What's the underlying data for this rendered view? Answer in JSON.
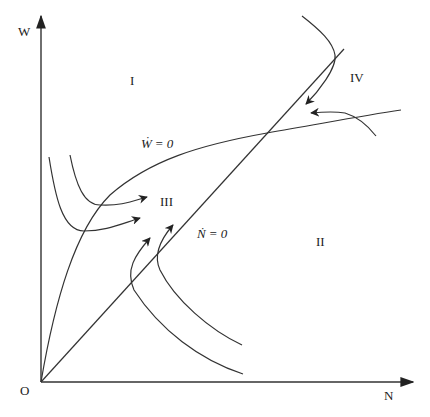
{
  "diagram": {
    "type": "phase-diagram",
    "axes": {
      "y_label": "W",
      "x_label": "N",
      "origin_label": "O"
    },
    "curves": {
      "w_dot_zero": {
        "symbol": "Ẇ",
        "equals": "= 0"
      },
      "n_dot_zero": {
        "symbol": "Ṅ",
        "equals": "= 0"
      }
    },
    "regions": [
      {
        "label": "I"
      },
      {
        "label": "II"
      },
      {
        "label": "III"
      },
      {
        "label": "IV"
      }
    ],
    "trajectories": [
      {
        "name": "region-I-upper-left-trajectory",
        "direction": "right"
      },
      {
        "name": "region-I-lower-left-trajectory",
        "direction": "right"
      },
      {
        "name": "region-II-inner-trajectory",
        "direction": "up"
      },
      {
        "name": "region-II-outer-trajectory",
        "direction": "up"
      },
      {
        "name": "region-IV-upper-trajectory",
        "direction": "down-left"
      },
      {
        "name": "region-IV-lower-trajectory",
        "direction": "left"
      }
    ],
    "colors": {
      "stroke": "#333333",
      "text": "#222222",
      "background": "#ffffff"
    }
  }
}
